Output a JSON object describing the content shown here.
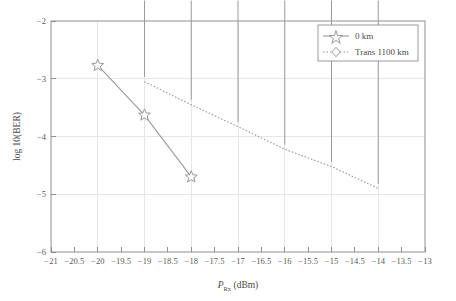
{
  "chart_data": {
    "type": "line",
    "title": "",
    "xlabel": "P_Rx (dBm)",
    "xlabel_main": "P",
    "xlabel_sub": "Rx",
    "xlabel_unit": " (dBm)",
    "ylabel": "log 10(BER)",
    "xlim": [
      -21,
      -13
    ],
    "ylim": [
      -6,
      -2
    ],
    "grid": true,
    "legend_position": "top-right",
    "xticks": [
      -21,
      -20.5,
      -20,
      -19.5,
      -19,
      -18.5,
      -18,
      -17.5,
      -17,
      -16.5,
      -16,
      -15.5,
      -15,
      -14.5,
      -14,
      -13.5,
      -13
    ],
    "xtick_labels": [
      "−21",
      "−20.5",
      "−20",
      "−19.5",
      "−19",
      "−18.5",
      "−18",
      "−17.5",
      "−17",
      "−16.5",
      "−16",
      "−15.5",
      "−15",
      "−14.5",
      "−14",
      "−13.5",
      "−13"
    ],
    "yticks": [
      -2,
      -3,
      -4,
      -5,
      -6
    ],
    "ytick_labels": [
      "−2",
      "−3",
      "−4",
      "−5",
      "−6"
    ],
    "gridlines_x": [
      -20,
      -19,
      -18,
      -17,
      -16,
      -15,
      -14
    ],
    "gridlines_y": [
      -3,
      -4,
      -5
    ],
    "series": [
      {
        "name": "0 km",
        "marker": "star",
        "linestyle": "solid",
        "color": "#9a9a9a",
        "x": [
          -20,
          -19,
          -18
        ],
        "values": [
          -2.77,
          -3.63,
          -4.7
        ]
      },
      {
        "name": "Trans 1100 km",
        "marker": "diamond",
        "linestyle": "dotted",
        "color": "#9a9a9a",
        "x": [
          -19,
          -18,
          -17,
          -16,
          -15,
          -14
        ],
        "values": [
          -3.05,
          -3.45,
          -3.83,
          -4.22,
          -4.52,
          -4.9
        ]
      }
    ]
  },
  "legend": {
    "items": [
      {
        "label": "0 km"
      },
      {
        "label": "Trans 1100 km"
      }
    ]
  }
}
